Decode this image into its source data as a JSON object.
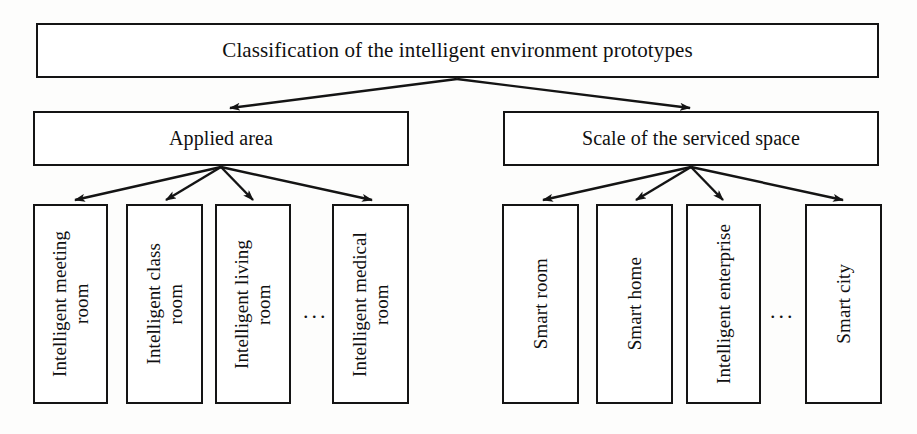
{
  "diagram": {
    "title_node": {
      "id": "root",
      "label": "Classification of the intelligent environment prototypes"
    },
    "branches": [
      {
        "id": "applied-area",
        "label": "Applied area",
        "children": [
          {
            "id": "intelligent-meeting-room",
            "label": "Intelligent meeting\nroom"
          },
          {
            "id": "intelligent-class-room",
            "label": "Intelligent class\nroom"
          },
          {
            "id": "intelligent-living-room",
            "label": "Intelligent living\nroom"
          },
          {
            "id": "ellipsis-left",
            "label": "..."
          },
          {
            "id": "intelligent-medical-room",
            "label": "Intelligent medical\nroom"
          }
        ]
      },
      {
        "id": "scale-of-serviced-space",
        "label": "Scale of the serviced space",
        "children": [
          {
            "id": "smart-room",
            "label": "Smart room"
          },
          {
            "id": "smart-home",
            "label": "Smart home"
          },
          {
            "id": "intelligent-enterprise",
            "label": "Intelligent enterprise"
          },
          {
            "id": "ellipsis-right",
            "label": "..."
          },
          {
            "id": "smart-city",
            "label": "Smart city"
          }
        ]
      }
    ],
    "style": {
      "line_color": "#141414",
      "box_fill": "#ffffff",
      "text_color": "#101010",
      "background": "#fdfdfc"
    }
  }
}
